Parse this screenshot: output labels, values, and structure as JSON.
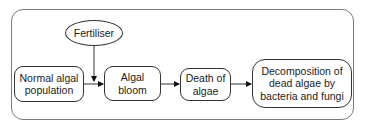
{
  "diagram": {
    "type": "flowchart",
    "input": {
      "label": "Fertiliser"
    },
    "nodes": [
      {
        "id": "normal",
        "label": "Normal algal population"
      },
      {
        "id": "bloom",
        "label": "Algal bloom"
      },
      {
        "id": "death",
        "label": "Death of algae"
      },
      {
        "id": "decomp",
        "label": "Decomposition of dead algae by bacteria and fungi"
      }
    ],
    "edges": [
      {
        "from": "normal",
        "to": "bloom"
      },
      {
        "from": "fertiliser",
        "to": "normal-bloom-edge"
      },
      {
        "from": "bloom",
        "to": "death"
      },
      {
        "from": "death",
        "to": "decomp"
      }
    ],
    "colors": {
      "frame": "#7a7a7a",
      "stroke": "#333333",
      "text": "#222222"
    }
  }
}
